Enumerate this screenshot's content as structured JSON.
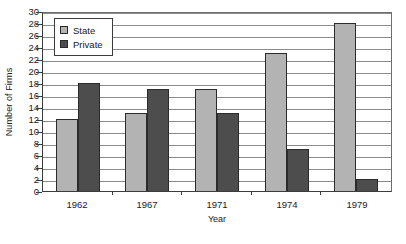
{
  "chart_data": {
    "type": "bar",
    "title": "",
    "xlabel": "Year",
    "ylabel": "Number of Firms",
    "categories": [
      "1962",
      "1967",
      "1971",
      "1974",
      "1979"
    ],
    "series": [
      {
        "name": "State",
        "color": "#b3b3b3",
        "values": [
          12,
          13,
          17,
          23,
          28
        ]
      },
      {
        "name": "Private",
        "color": "#4d4d4d",
        "values": [
          18,
          17,
          13,
          7,
          2
        ]
      }
    ],
    "ylim": [
      0,
      30
    ],
    "ytick_step": 2,
    "yticks": [
      30,
      28,
      26,
      24,
      22,
      20,
      18,
      16,
      14,
      12,
      10,
      8,
      6,
      4,
      2,
      0
    ],
    "grid": true,
    "grid_axis": "y",
    "legend_position": "top-left",
    "legend_entries": [
      "State",
      "Private"
    ],
    "annotations": []
  }
}
